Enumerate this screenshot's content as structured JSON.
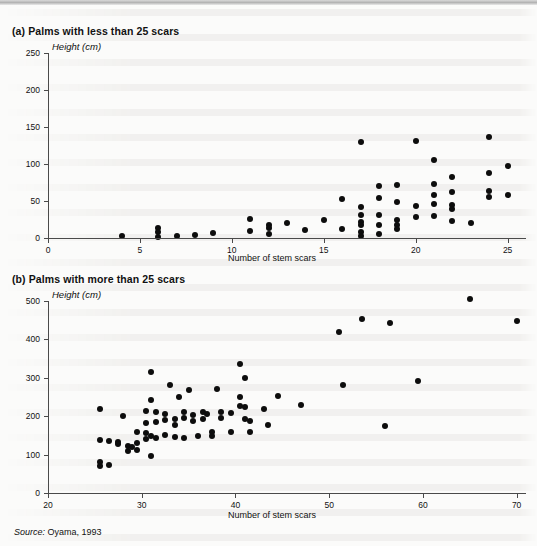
{
  "figure": {
    "source_note_prefix": "Source:",
    "source_note": "Oyama, 1993"
  },
  "chart_data": [
    {
      "id": "panel-a",
      "type": "scatter",
      "title": "(a) Palms with less than 25 scars",
      "xlabel": "Number of stem scars",
      "ylabel": "Height (cm)",
      "xlim": [
        0,
        26
      ],
      "ylim": [
        0,
        250
      ],
      "xticks": [
        0,
        5,
        10,
        15,
        20,
        25
      ],
      "yticks": [
        0,
        50,
        100,
        150,
        200,
        250
      ],
      "xtick_labels": [
        "0",
        "5",
        "10",
        "15",
        "20",
        "25"
      ],
      "ytick_labels": [
        "0",
        "50",
        "100",
        "150",
        "200",
        "250"
      ],
      "grid": false,
      "legend": "none",
      "marker_color": "#0d0d0d",
      "points": [
        [
          4.0,
          3
        ],
        [
          6.0,
          13
        ],
        [
          6.0,
          8
        ],
        [
          6.0,
          2
        ],
        [
          7.0,
          3
        ],
        [
          8.0,
          4
        ],
        [
          9.0,
          7
        ],
        [
          11.0,
          26
        ],
        [
          11.0,
          9
        ],
        [
          12.0,
          17
        ],
        [
          12.0,
          13
        ],
        [
          12.0,
          5
        ],
        [
          13.0,
          20
        ],
        [
          14.0,
          11
        ],
        [
          15.0,
          25
        ],
        [
          16.0,
          53
        ],
        [
          16.0,
          12
        ],
        [
          17.0,
          130
        ],
        [
          17.0,
          42
        ],
        [
          17.0,
          31
        ],
        [
          17.0,
          22
        ],
        [
          17.0,
          17
        ],
        [
          17.0,
          8
        ],
        [
          17.0,
          3
        ],
        [
          18.0,
          70
        ],
        [
          18.0,
          54
        ],
        [
          18.0,
          31
        ],
        [
          18.0,
          18
        ],
        [
          18.0,
          6
        ],
        [
          19.0,
          71
        ],
        [
          19.0,
          48
        ],
        [
          19.0,
          25
        ],
        [
          19.0,
          18
        ],
        [
          19.0,
          12
        ],
        [
          20.0,
          131
        ],
        [
          20.0,
          43
        ],
        [
          20.0,
          29
        ],
        [
          21.0,
          105
        ],
        [
          21.0,
          73
        ],
        [
          21.0,
          58
        ],
        [
          21.0,
          46
        ],
        [
          21.0,
          30
        ],
        [
          22.0,
          82
        ],
        [
          22.0,
          62
        ],
        [
          22.0,
          45
        ],
        [
          22.0,
          39
        ],
        [
          22.0,
          23
        ],
        [
          23.0,
          20
        ],
        [
          24.0,
          136
        ],
        [
          24.0,
          88
        ],
        [
          24.0,
          63
        ],
        [
          24.0,
          56
        ],
        [
          25.0,
          97
        ],
        [
          25.0,
          58
        ]
      ]
    },
    {
      "id": "panel-b",
      "type": "scatter",
      "title": "(b) Palms with more than 25 scars",
      "xlabel": "Number of stem scars",
      "ylabel": "Height (cm)",
      "xlim": [
        20,
        71
      ],
      "ylim": [
        0,
        500
      ],
      "xticks": [
        20,
        30,
        40,
        50,
        60,
        70
      ],
      "yticks": [
        0,
        100,
        200,
        300,
        400,
        500
      ],
      "xtick_labels": [
        "20",
        "30",
        "40",
        "50",
        "60",
        "70"
      ],
      "ytick_labels": [
        "0",
        "100",
        "200",
        "300",
        "400",
        "500"
      ],
      "grid": false,
      "legend": "none",
      "marker_color": "#0d0d0d",
      "points": [
        [
          25.5,
          218
        ],
        [
          25.5,
          137
        ],
        [
          25.5,
          80
        ],
        [
          25.5,
          70
        ],
        [
          26.5,
          135
        ],
        [
          26.5,
          72
        ],
        [
          27.5,
          133
        ],
        [
          27.5,
          128
        ],
        [
          28.0,
          200
        ],
        [
          28.5,
          122
        ],
        [
          28.5,
          110
        ],
        [
          29.0,
          120
        ],
        [
          29.5,
          160
        ],
        [
          29.5,
          131
        ],
        [
          29.5,
          113
        ],
        [
          30.5,
          213
        ],
        [
          30.5,
          183
        ],
        [
          30.5,
          155
        ],
        [
          30.5,
          140
        ],
        [
          31.0,
          315
        ],
        [
          31.0,
          243
        ],
        [
          31.0,
          148
        ],
        [
          31.0,
          97
        ],
        [
          31.5,
          210
        ],
        [
          31.5,
          185
        ],
        [
          31.5,
          143
        ],
        [
          32.5,
          206
        ],
        [
          32.5,
          191
        ],
        [
          32.5,
          152
        ],
        [
          33.0,
          280
        ],
        [
          33.5,
          192
        ],
        [
          33.5,
          178
        ],
        [
          33.5,
          145
        ],
        [
          34.0,
          250
        ],
        [
          34.5,
          212
        ],
        [
          34.5,
          196
        ],
        [
          34.5,
          142
        ],
        [
          35.0,
          268
        ],
        [
          35.5,
          203
        ],
        [
          35.5,
          187
        ],
        [
          36.0,
          148
        ],
        [
          36.5,
          210
        ],
        [
          36.5,
          193
        ],
        [
          37.0,
          205
        ],
        [
          37.5,
          160
        ],
        [
          37.5,
          148
        ],
        [
          38.0,
          272
        ],
        [
          38.5,
          210
        ],
        [
          38.5,
          196
        ],
        [
          39.5,
          208
        ],
        [
          39.5,
          160
        ],
        [
          40.5,
          335
        ],
        [
          40.5,
          250
        ],
        [
          40.5,
          226
        ],
        [
          41.0,
          300
        ],
        [
          41.0,
          223
        ],
        [
          41.0,
          194
        ],
        [
          41.5,
          188
        ],
        [
          41.5,
          158
        ],
        [
          43.0,
          218
        ],
        [
          43.5,
          178
        ],
        [
          44.5,
          252
        ],
        [
          47.0,
          230
        ],
        [
          51.0,
          418
        ],
        [
          51.5,
          280
        ],
        [
          53.5,
          452
        ],
        [
          56.0,
          175
        ],
        [
          56.5,
          443
        ],
        [
          59.5,
          292
        ],
        [
          65.0,
          505
        ],
        [
          70.0,
          447
        ]
      ]
    }
  ]
}
